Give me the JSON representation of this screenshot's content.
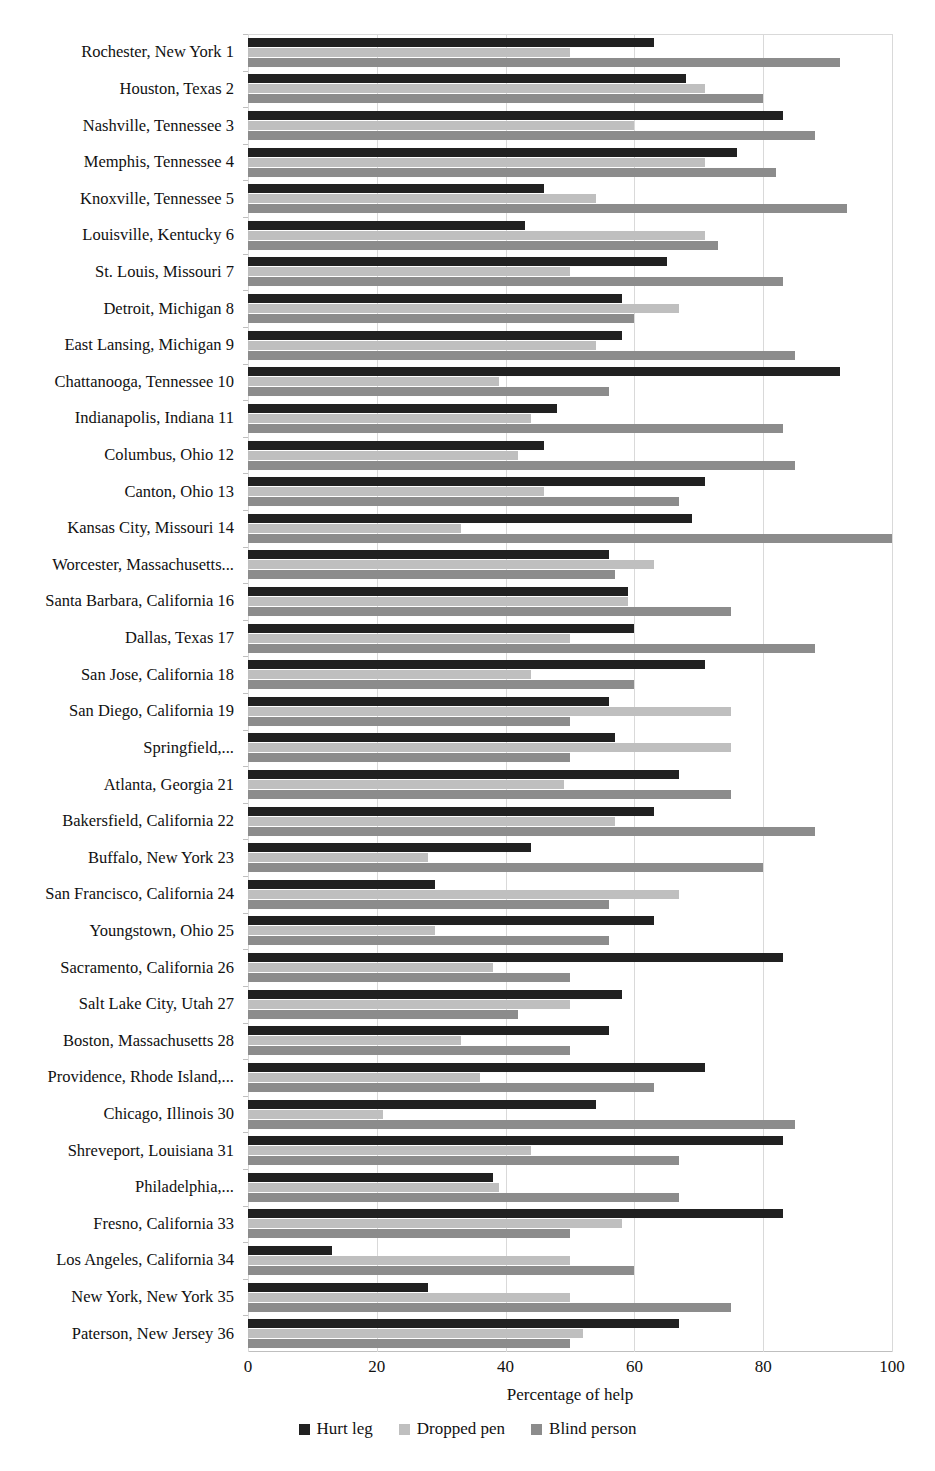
{
  "chart_data": {
    "type": "bar",
    "orientation": "horizontal",
    "title": "",
    "xlabel": "Percentage of help",
    "ylabel": "",
    "xlim": [
      0,
      100
    ],
    "xticks": [
      0,
      20,
      40,
      60,
      80,
      100
    ],
    "grid": true,
    "legend_position": "bottom",
    "categories": [
      "Rochester, New York 1",
      "Houston, Texas 2",
      "Nashville, Tennessee 3",
      "Memphis, Tennessee 4",
      "Knoxville, Tennessee 5",
      "Louisville, Kentucky 6",
      "St. Louis, Missouri 7",
      "Detroit, Michigan 8",
      "East Lansing, Michigan 9",
      "Chattanooga, Tennessee 10",
      "Indianapolis, Indiana 11",
      "Columbus, Ohio 12",
      "Canton, Ohio 13",
      "Kansas City, Missouri 14",
      "Worcester, Massachusetts...",
      "Santa Barbara, California 16",
      "Dallas, Texas 17",
      "San Jose, California 18",
      "San Diego, California 19",
      "Springfield,...",
      "Atlanta, Georgia 21",
      "Bakersfield, California 22",
      "Buffalo, New York 23",
      "San Francisco, California 24",
      "Youngstown, Ohio 25",
      "Sacramento, California 26",
      "Salt Lake City, Utah 27",
      "Boston, Massachusetts 28",
      "Providence, Rhode Island,...",
      "Chicago, Illinois 30",
      "Shreveport, Louisiana 31",
      "Philadelphia,...",
      "Fresno, California 33",
      "Los Angeles, California 34",
      "New York, New York 35",
      "Paterson, New Jersey 36"
    ],
    "series": [
      {
        "name": "Hurt leg",
        "color": "#212121",
        "values": [
          63,
          68,
          83,
          76,
          46,
          43,
          65,
          58,
          58,
          92,
          48,
          46,
          71,
          69,
          56,
          59,
          60,
          71,
          56,
          57,
          67,
          63,
          44,
          29,
          63,
          83,
          58,
          56,
          71,
          54,
          83,
          38,
          83,
          13,
          28,
          67
        ]
      },
      {
        "name": "Dropped pen",
        "color": "#bfbfbf",
        "values": [
          50,
          71,
          60,
          71,
          54,
          71,
          50,
          67,
          54,
          39,
          44,
          42,
          46,
          33,
          63,
          59,
          50,
          44,
          75,
          75,
          49,
          57,
          28,
          67,
          29,
          38,
          50,
          33,
          36,
          21,
          44,
          39,
          58,
          50,
          50,
          52
        ]
      },
      {
        "name": "Blind person",
        "color": "#8c8c8c",
        "values": [
          92,
          80,
          88,
          82,
          93,
          73,
          83,
          60,
          85,
          56,
          83,
          85,
          67,
          100,
          57,
          75,
          88,
          60,
          50,
          50,
          75,
          88,
          80,
          56,
          56,
          50,
          42,
          50,
          63,
          85,
          67,
          67,
          50,
          60,
          75,
          50
        ]
      }
    ]
  },
  "axis": {
    "tick_labels": [
      "0",
      "20",
      "40",
      "60",
      "80",
      "100"
    ],
    "x_title": "Percentage of help"
  },
  "legend": {
    "items": [
      {
        "label": "Hurt leg",
        "color": "#212121"
      },
      {
        "label": "Dropped pen",
        "color": "#bfbfbf"
      },
      {
        "label": "Blind person",
        "color": "#8c8c8c"
      }
    ]
  }
}
